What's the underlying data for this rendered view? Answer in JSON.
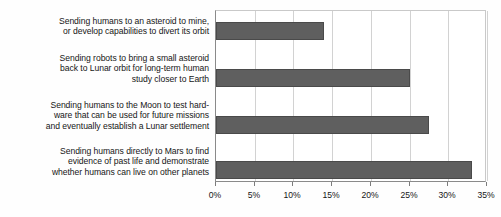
{
  "chart_data": {
    "type": "bar",
    "orientation": "horizontal",
    "title": "",
    "xlabel": "",
    "ylabel": "",
    "categories": [
      "Sending humans to an asteroid to mine, or develop capabilities to divert its orbit",
      "Sending robots to bring a small asteroid back to Lunar orbit for long-term human study closer to Earth",
      "Sending humans to the Moon to test hardware that can be used for future missions and eventually establish a Lunar settlement",
      "Sending humans directly to Mars to find evidence of past life and demonstrate whether humans can live on other planets"
    ],
    "values": [
      14,
      25,
      27.5,
      33
    ],
    "xlim": [
      0,
      35
    ],
    "xticks": [
      0,
      5,
      10,
      15,
      20,
      25,
      30,
      35
    ],
    "xtick_labels": [
      "0%",
      "5%",
      "10%",
      "15%",
      "20%",
      "25%",
      "30%",
      "35%"
    ],
    "grid": true,
    "legend": null,
    "bar_color": "#5f5f5f",
    "gridline_color": "#d2d2d2",
    "axis_color": "#8a8a8a"
  },
  "labels": {
    "lines": [
      [
        "Sending humans to an asteroid to mine,",
        "or develop capabilities to divert its orbit"
      ],
      [
        "Sending robots to bring a small asteroid",
        "back to Lunar orbit for long-term human",
        "study closer to Earth"
      ],
      [
        "Sending humans to the Moon to test hard-",
        "ware that can be used for future missions",
        "and eventually establish a Lunar settlement"
      ],
      [
        "Sending humans directly to Mars to find",
        "evidence of past life and demonstrate",
        "whether humans can live on other planets"
      ]
    ]
  }
}
